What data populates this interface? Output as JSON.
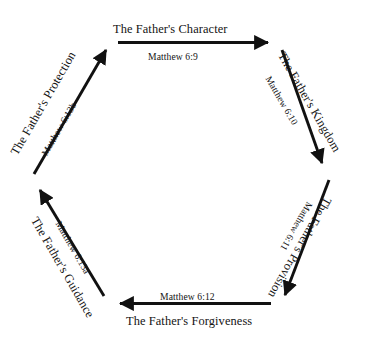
{
  "diagram": {
    "type": "cycle-hexagon",
    "shape": "hexagon",
    "direction": "clockwise",
    "stroke_color": "#111111",
    "background_color": "#ffffff",
    "node_count": 6,
    "steps": [
      {
        "id": "character",
        "title": "The Father's Character",
        "reference": "Matthew 6:9",
        "edge": "top",
        "arrow_direction": "right"
      },
      {
        "id": "kingdom",
        "title": "The Father's Kingdom",
        "reference": "Matthew 6:10",
        "edge": "upper-right",
        "arrow_direction": "down-right"
      },
      {
        "id": "provision",
        "title": "The Father's Provision",
        "reference": "Matthew 6:11",
        "edge": "lower-right",
        "arrow_direction": "down-left"
      },
      {
        "id": "forgiveness",
        "title": "The Father's Forgiveness",
        "reference": "Matthew 6:12",
        "edge": "bottom",
        "arrow_direction": "left"
      },
      {
        "id": "guidance",
        "title": "The Father's Guidance",
        "reference": "Matthew 6:13a",
        "edge": "lower-left",
        "arrow_direction": "up-left"
      },
      {
        "id": "protection",
        "title": "The Father's Protection",
        "reference": "Matthew 6:13b",
        "edge": "upper-left",
        "arrow_direction": "up-right"
      }
    ]
  }
}
